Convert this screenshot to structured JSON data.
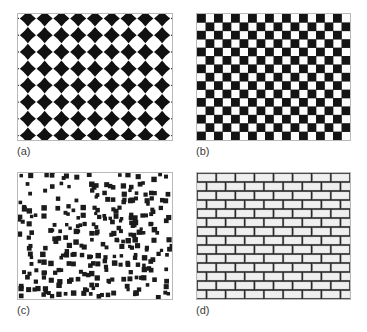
{
  "figure": {
    "background_color": "#ffffff",
    "frame_color": "#b9b9b9",
    "ink_color": "#1a1a1a",
    "paper_color": "#ffffff",
    "width": 367,
    "height": 332
  },
  "panels": [
    {
      "id": "a",
      "label": "(a)",
      "pattern": "diamond-star-grid",
      "description": "Regular grid of concave four-pointed diamond (astroid) motifs, black on white",
      "geometry": {
        "cell": 17,
        "columns": 9,
        "rows": 8,
        "motif_radius": 8.2,
        "concavity": 0.42
      },
      "colors": {
        "foreground": "#111111",
        "background": "#ffffff"
      }
    },
    {
      "id": "b",
      "label": "(b)",
      "pattern": "checkerboard",
      "description": "Regular alternating black and white square checkerboard",
      "geometry": {
        "cell": 8.6,
        "columns": 18,
        "rows": 15
      },
      "colors": {
        "foreground": "#141414",
        "background": "#fcfcfc"
      }
    },
    {
      "id": "c",
      "label": "(c)",
      "pattern": "random-squares",
      "description": "Quasi-random jittered field of small black squares on white",
      "geometry": {
        "cell": 8.0,
        "columns": 20,
        "rows": 16,
        "square_size": 4.3,
        "jitter": 2.6,
        "density": 0.62
      },
      "colors": {
        "foreground": "#1b1b1b",
        "background": "#ffffff"
      }
    },
    {
      "id": "d",
      "label": "(d)",
      "pattern": "brick-wall",
      "description": "Running-bond brick wall with dark mortar lines and light grey bricks",
      "geometry": {
        "brick_width": 21,
        "brick_height": 9.2,
        "mortar": 2.0,
        "columns": 8,
        "rows": 14,
        "offset": 0.5
      },
      "colors": {
        "mortar": "#2a2a2a",
        "brick": "#efefef",
        "brick_edge": "#c8c8c8"
      }
    }
  ],
  "chart_data": {
    "type": "table",
    "categories": [
      "(a)",
      "(b)",
      "(c)",
      "(d)"
    ],
    "series": [
      {
        "name": "pattern",
        "values": [
          "diamond-star-grid",
          "checkerboard",
          "random-squares",
          "brick-wall"
        ]
      },
      {
        "name": "periodicity",
        "values": [
          "periodic",
          "periodic",
          "stochastic",
          "periodic"
        ]
      }
    ],
    "xlabel": "",
    "ylabel": "",
    "grid": false,
    "legend": "none"
  }
}
